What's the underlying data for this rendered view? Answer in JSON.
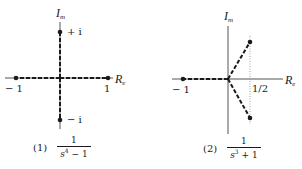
{
  "diagrams": [
    {
      "id": 1,
      "axis_labels": {
        "imag": "I",
        "imag_sub": "m",
        "real": "R",
        "real_sub": "e"
      },
      "point_labels": {
        "plus_i": "+ i",
        "minus_i": "− i",
        "neg_one": "− 1",
        "one": "1"
      },
      "caption": {
        "number": "(1)",
        "numerator": "1",
        "den_base": "s",
        "den_exp": "4",
        "den_rest": " − 1"
      },
      "poles": [
        "1",
        "-1",
        "i",
        "-i"
      ]
    },
    {
      "id": 2,
      "axis_labels": {
        "imag": "I",
        "imag_sub": "m",
        "real": "R",
        "real_sub": "e"
      },
      "point_labels": {
        "neg_one": "− 1",
        "half": "1/2"
      },
      "caption": {
        "number": "(2)",
        "numerator": "1",
        "den_base": "s",
        "den_exp": "3",
        "den_rest": " + 1"
      },
      "poles": [
        "-1",
        "1/2 + i√3/2",
        "1/2 − i√3/2"
      ]
    }
  ],
  "colors": {
    "ink": "#1a1a1a",
    "axis": "#555555",
    "dotted": "#888888"
  }
}
